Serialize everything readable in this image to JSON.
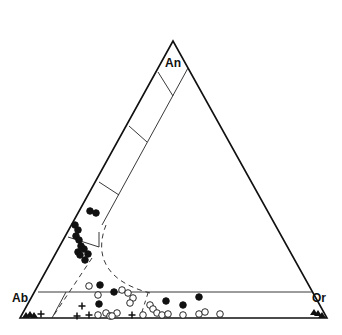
{
  "diagram": {
    "type": "ternary-feldspar",
    "vertices": {
      "top": {
        "label": "An",
        "x": 173,
        "y": 41
      },
      "left": {
        "label": "Ab",
        "x": 20,
        "y": 318
      },
      "right": {
        "label": "Or",
        "x": 327,
        "y": 318
      }
    },
    "colors": {
      "line": "#111111",
      "fill_symbol": "#111111",
      "background": "#ffffff"
    }
  },
  "labels": {
    "an": "An",
    "ab": "Ab",
    "or": "Or"
  },
  "chart_data": {
    "type": "scatter",
    "title": "",
    "axes": [
      "An",
      "Ab",
      "Or"
    ],
    "series": [
      {
        "name": "filled circles",
        "marker": "filled-circle",
        "points": [
          [
            90,
            211
          ],
          [
            96,
            213
          ],
          [
            75,
            225
          ],
          [
            78,
            230
          ],
          [
            76,
            236
          ],
          [
            79,
            240
          ],
          [
            81,
            246
          ],
          [
            78,
            252
          ],
          [
            84,
            249
          ],
          [
            88,
            254
          ],
          [
            80,
            255
          ],
          [
            85,
            260
          ],
          [
            100,
            285
          ],
          [
            114,
            292
          ],
          [
            99,
            304
          ],
          [
            166,
            301
          ],
          [
            183,
            305
          ],
          [
            199,
            297
          ]
        ]
      },
      {
        "name": "open circles",
        "marker": "open-circle",
        "points": [
          [
            89,
            286
          ],
          [
            98,
            295
          ],
          [
            122,
            290
          ],
          [
            128,
            293
          ],
          [
            133,
            298
          ],
          [
            130,
            303
          ],
          [
            150,
            305
          ],
          [
            153,
            309
          ],
          [
            157,
            313
          ],
          [
            162,
            315
          ],
          [
            168,
            314
          ],
          [
            143,
            315
          ],
          [
            98,
            315
          ],
          [
            106,
            313
          ],
          [
            110,
            316
          ],
          [
            117,
            313
          ],
          [
            112,
            316
          ],
          [
            183,
            315
          ],
          [
            199,
            314
          ],
          [
            205,
            312
          ],
          [
            220,
            314
          ]
        ]
      },
      {
        "name": "crosses",
        "marker": "plus",
        "points": [
          [
            41,
            314
          ],
          [
            82,
            306
          ],
          [
            77,
            316
          ],
          [
            89,
            315
          ],
          [
            132,
            315
          ]
        ]
      },
      {
        "name": "triangles",
        "marker": "filled-triangle",
        "points": [
          [
            26,
            316
          ],
          [
            30,
            315
          ],
          [
            34,
            316
          ],
          [
            314,
            313
          ],
          [
            318,
            314
          ],
          [
            322,
            316
          ]
        ]
      }
    ]
  }
}
